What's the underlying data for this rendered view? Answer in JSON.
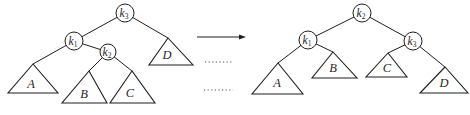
{
  "colors": {
    "ink": "#1f1f1f",
    "dotted": "#8c8c8c",
    "background": "#ffffff"
  },
  "left_tree": {
    "nodes": {
      "k3": {
        "base": "k",
        "sub": "3"
      },
      "k1": {
        "base": "k",
        "sub": "1"
      },
      "k2": {
        "base": "k",
        "sub": "2"
      }
    },
    "subtrees": {
      "a": "A",
      "b": "B",
      "c": "C",
      "d": "D"
    }
  },
  "right_tree": {
    "nodes": {
      "k2": {
        "base": "k",
        "sub": "2"
      },
      "k1": {
        "base": "k",
        "sub": "1"
      },
      "k3": {
        "base": "k",
        "sub": "3"
      }
    },
    "subtrees": {
      "a": "A",
      "b": "B",
      "c": "C",
      "d": "D"
    }
  }
}
